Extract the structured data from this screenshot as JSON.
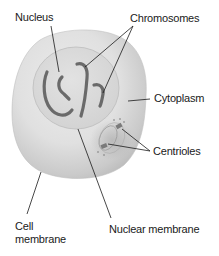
{
  "diagram": {
    "type": "animal-cell-labeled",
    "labels": {
      "nucleus": "Nucleus",
      "chromosomes": "Chromosomes",
      "cytoplasm": "Cytoplasm",
      "centrioles": "Centrioles",
      "cell_membrane_line1": "Cell",
      "cell_membrane_line2": "membrane",
      "nuclear_membrane": "Nuclear membrane"
    },
    "colors": {
      "background": "#ffffff",
      "cell_fill_light": "#e6e6e6",
      "cell_fill_dark": "#b4b4b4",
      "nucleus_fill": "#dadada",
      "nucleus_outline": "#c4c4c4",
      "chromosome": "#6a6a6a",
      "centriole": "#7a7a7a",
      "leader_line": "#1a1a1a",
      "text": "#1a1a1a"
    }
  }
}
